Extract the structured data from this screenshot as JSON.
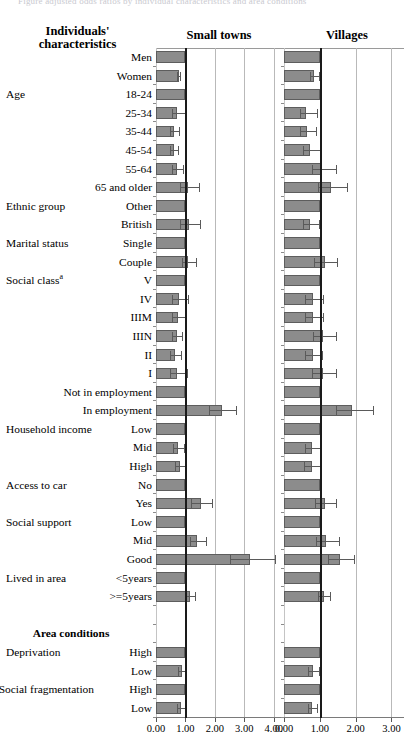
{
  "figure": {
    "top_caption": "Figure adjusted odds ratios by individual characteristics and area conditions",
    "label_header_line1": "Individuals'",
    "label_header_line2": "characteristics",
    "section_header": "Area conditions"
  },
  "panels": [
    {
      "key": "smalltowns",
      "title": "Small towns",
      "xmin": 0.0,
      "xmax": 4.35,
      "ticks": [
        0.0,
        1.0,
        2.0,
        3.0,
        4.0
      ],
      "ticklabels": [
        "0.00",
        "1.00",
        "2.00",
        "3.00",
        "4.00"
      ],
      "reference_line": 1.0
    },
    {
      "key": "villages",
      "title": "Villages",
      "xmin": 0.0,
      "xmax": 3.35,
      "ticks": [
        0.0,
        1.0,
        2.0,
        3.0
      ],
      "ticklabels": [
        "0.00",
        "1.00",
        "2.00",
        "3.00"
      ],
      "reference_line": 1.0
    }
  ],
  "rows": [
    {
      "group": "",
      "level": "Men",
      "kind": "data"
    },
    {
      "group": "",
      "level": "Women",
      "kind": "data"
    },
    {
      "group": "Age",
      "level": "18-24",
      "kind": "data"
    },
    {
      "group": "",
      "level": "25-34",
      "kind": "data"
    },
    {
      "group": "",
      "level": "35-44",
      "kind": "data"
    },
    {
      "group": "",
      "level": "45-54",
      "kind": "data"
    },
    {
      "group": "",
      "level": "55-64",
      "kind": "data"
    },
    {
      "group": "",
      "level": "65 and older",
      "kind": "data"
    },
    {
      "group": "Ethnic group",
      "level": "Other",
      "kind": "data"
    },
    {
      "group": "",
      "level": "British",
      "kind": "data"
    },
    {
      "group": "Marital status",
      "level": "Single",
      "kind": "data"
    },
    {
      "group": "",
      "level": "Couple",
      "kind": "data"
    },
    {
      "group": "Social class",
      "level": "V",
      "kind": "data",
      "superscript": "a"
    },
    {
      "group": "",
      "level": "IV",
      "kind": "data"
    },
    {
      "group": "",
      "level": "IIIM",
      "kind": "data"
    },
    {
      "group": "",
      "level": "IIIN",
      "kind": "data"
    },
    {
      "group": "",
      "level": "II",
      "kind": "data"
    },
    {
      "group": "",
      "level": "I",
      "kind": "data"
    },
    {
      "group": "",
      "level": "Not in employment",
      "kind": "data"
    },
    {
      "group": "",
      "level": "In employment",
      "kind": "data"
    },
    {
      "group": "Household income",
      "level": "Low",
      "kind": "data"
    },
    {
      "group": "",
      "level": "Mid",
      "kind": "data"
    },
    {
      "group": "",
      "level": "High",
      "kind": "data"
    },
    {
      "group": "Access to car",
      "level": "No",
      "kind": "data"
    },
    {
      "group": "",
      "level": "Yes",
      "kind": "data"
    },
    {
      "group": "Social support",
      "level": "Low",
      "kind": "data"
    },
    {
      "group": "",
      "level": "Mid",
      "kind": "data"
    },
    {
      "group": "",
      "level": "Good",
      "kind": "data"
    },
    {
      "group": "Lived in area",
      "level": "<5years",
      "kind": "data"
    },
    {
      "group": "",
      "level": ">=5years",
      "kind": "data"
    },
    {
      "group": "",
      "level": "",
      "kind": "spacer"
    },
    {
      "group": "",
      "level": "Area conditions",
      "kind": "section"
    },
    {
      "group": "Deprivation",
      "level": "High",
      "kind": "data"
    },
    {
      "group": "",
      "level": "Low",
      "kind": "data"
    },
    {
      "group": "Social fragmentation",
      "level": "High",
      "kind": "data"
    },
    {
      "group": "",
      "level": "Low",
      "kind": "data"
    }
  ],
  "chart_data": {
    "type": "bar",
    "xlabel": "Odds ratio",
    "ylabel": "",
    "grid": true,
    "legend": "none",
    "orientation": "horizontal",
    "reference_line": 1.0,
    "categories": [
      "Men",
      "Women",
      "Age 18-24",
      "25-34",
      "35-44",
      "45-54",
      "55-64",
      "65 and older",
      "Ethnic group Other",
      "British",
      "Marital status Single",
      "Couple",
      "Social class V",
      "IV",
      "IIIM",
      "IIIN",
      "II",
      "I",
      "Not in employment",
      "In employment",
      "Household income Low",
      "Mid",
      "High",
      "Access to car No",
      "Yes",
      "Social support Low",
      "Mid",
      "Good",
      "Lived in area <5years",
      ">=5years",
      "Deprivation High",
      "Low",
      "Social fragmentation High",
      "Low"
    ],
    "series": [
      {
        "name": "Small towns",
        "xlim": [
          0.0,
          4.35
        ],
        "ticks": [
          0.0,
          1.0,
          2.0,
          3.0,
          4.0
        ],
        "values": [
          1.0,
          0.78,
          1.0,
          0.72,
          0.61,
          0.61,
          0.73,
          1.09,
          1.0,
          1.11,
          1.0,
          1.1,
          1.0,
          0.79,
          0.75,
          0.71,
          0.66,
          0.72,
          1.0,
          2.24,
          1.0,
          0.76,
          0.83,
          1.0,
          1.52,
          1.0,
          1.41,
          3.21,
          1.0,
          1.16,
          1.0,
          0.9,
          1.0,
          0.86
        ],
        "ci_low": [
          null,
          0.72,
          null,
          0.55,
          0.47,
          0.47,
          0.56,
          0.82,
          null,
          0.8,
          null,
          0.88,
          null,
          0.56,
          0.55,
          0.55,
          0.49,
          0.49,
          null,
          1.8,
          null,
          0.57,
          0.65,
          null,
          1.2,
          null,
          1.14,
          2.5,
          null,
          1.0,
          null,
          0.76,
          null,
          0.72
        ],
        "ci_high": [
          null,
          0.86,
          null,
          1.04,
          0.8,
          0.79,
          0.96,
          1.48,
          null,
          1.53,
          null,
          1.38,
          null,
          1.12,
          1.04,
          0.93,
          0.9,
          1.08,
          null,
          2.75,
          null,
          1.0,
          1.07,
          null,
          1.93,
          null,
          1.75,
          4.08,
          null,
          1.35,
          null,
          1.07,
          null,
          1.03
        ]
      },
      {
        "name": "Villages",
        "xlim": [
          0.0,
          3.35
        ],
        "ticks": [
          0.0,
          1.0,
          2.0,
          3.0
        ],
        "values": [
          1.0,
          0.85,
          1.0,
          0.62,
          0.63,
          0.72,
          1.05,
          1.3,
          1.0,
          0.73,
          1.0,
          1.14,
          1.0,
          0.8,
          0.81,
          1.09,
          0.8,
          1.08,
          1.0,
          1.91,
          1.0,
          0.78,
          0.77,
          1.0,
          1.14,
          1.0,
          1.18,
          1.55,
          1.0,
          1.12,
          1.0,
          0.82,
          1.0,
          0.79
        ],
        "ci_low": [
          null,
          0.73,
          null,
          0.45,
          0.46,
          0.53,
          0.77,
          0.94,
          null,
          0.54,
          null,
          0.85,
          null,
          0.58,
          0.58,
          0.8,
          0.58,
          0.78,
          null,
          1.45,
          null,
          0.58,
          0.57,
          null,
          0.87,
          null,
          0.9,
          1.22,
          null,
          0.96,
          null,
          0.68,
          null,
          0.66
        ],
        "ci_high": [
          null,
          1.0,
          null,
          0.94,
          0.92,
          1.04,
          1.47,
          1.8,
          null,
          1.0,
          null,
          1.52,
          null,
          1.11,
          1.13,
          1.49,
          1.1,
          1.49,
          null,
          2.52,
          null,
          1.06,
          1.04,
          null,
          1.49,
          null,
          1.56,
          1.98,
          null,
          1.31,
          null,
          1.0,
          null,
          0.95
        ]
      }
    ]
  }
}
